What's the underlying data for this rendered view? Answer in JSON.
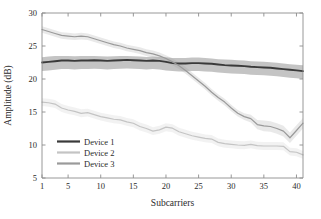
{
  "chart_data": {
    "type": "line",
    "title": "",
    "xlabel": "Subcarriers",
    "ylabel": "Amplitude (dB)",
    "xlim": [
      1,
      41
    ],
    "ylim": [
      5,
      30
    ],
    "xticks": [
      1,
      5,
      10,
      15,
      20,
      25,
      30,
      35,
      40
    ],
    "xticklabels": [
      "1",
      "5",
      "10",
      "15",
      "20",
      "25",
      "30",
      "35",
      "40"
    ],
    "yticks": [
      5,
      10,
      15,
      20,
      25,
      30
    ],
    "yticklabels": [
      "5",
      "10",
      "15",
      "20",
      "25",
      "30"
    ],
    "grid": false,
    "legend_position": "lower-left",
    "x": [
      1,
      2,
      3,
      4,
      5,
      6,
      7,
      8,
      9,
      10,
      11,
      12,
      13,
      14,
      15,
      16,
      17,
      18,
      19,
      20,
      21,
      22,
      23,
      24,
      25,
      26,
      27,
      28,
      29,
      30,
      31,
      32,
      33,
      34,
      35,
      36,
      37,
      38,
      39,
      40,
      41
    ],
    "series": [
      {
        "name": "Device 1",
        "color": "#3a3a3a",
        "values": [
          22.5,
          22.6,
          22.7,
          22.8,
          22.8,
          22.75,
          22.8,
          22.8,
          22.85,
          22.8,
          22.75,
          22.8,
          22.85,
          22.9,
          22.85,
          22.8,
          22.75,
          22.8,
          22.75,
          22.6,
          22.4,
          22.35,
          22.35,
          22.4,
          22.4,
          22.35,
          22.3,
          22.2,
          22.1,
          22.05,
          22.0,
          21.95,
          21.85,
          21.8,
          21.75,
          21.7,
          21.6,
          21.5,
          21.4,
          21.3,
          21.2
        ],
        "band_lower": [
          21.2,
          21.3,
          21.4,
          21.5,
          21.5,
          21.45,
          21.5,
          21.5,
          21.55,
          21.5,
          21.45,
          21.5,
          21.55,
          21.6,
          21.55,
          21.5,
          21.45,
          21.5,
          21.45,
          21.3,
          21.2,
          21.15,
          21.15,
          21.2,
          21.2,
          21.15,
          21.1,
          21.0,
          20.9,
          20.85,
          20.8,
          20.75,
          20.65,
          20.6,
          20.55,
          20.5,
          20.4,
          20.3,
          20.2,
          20.1,
          20.0
        ],
        "band_upper": [
          23.3,
          23.4,
          23.5,
          23.5,
          23.5,
          23.45,
          23.5,
          23.5,
          23.5,
          23.45,
          23.4,
          23.45,
          23.5,
          23.5,
          23.45,
          23.4,
          23.35,
          23.4,
          23.35,
          23.3,
          23.2,
          23.2,
          23.2,
          23.25,
          23.25,
          23.2,
          23.1,
          23.0,
          22.95,
          22.9,
          22.85,
          22.8,
          22.7,
          22.65,
          22.6,
          22.55,
          22.45,
          22.35,
          22.25,
          22.15,
          22.1
        ]
      },
      {
        "name": "Device 2",
        "color": "#c4c4c4",
        "values": [
          16.5,
          16.4,
          16.2,
          15.6,
          15.3,
          15.1,
          14.8,
          14.9,
          14.6,
          14.3,
          14.1,
          13.9,
          13.8,
          13.5,
          13.3,
          12.8,
          12.5,
          12.1,
          12.3,
          12.7,
          12.55,
          12.0,
          11.7,
          11.4,
          11.2,
          11.0,
          10.9,
          10.4,
          10.2,
          10.1,
          10.0,
          9.95,
          10.1,
          9.9,
          9.85,
          9.85,
          9.85,
          9.8,
          9.0,
          8.9,
          8.5
        ],
        "band_lower": [
          15.9,
          15.8,
          15.6,
          15.0,
          14.7,
          14.5,
          14.2,
          14.3,
          14.0,
          13.7,
          13.5,
          13.3,
          13.2,
          12.9,
          12.7,
          12.2,
          11.9,
          11.5,
          11.7,
          12.1,
          11.95,
          11.4,
          11.1,
          10.8,
          10.6,
          10.4,
          10.3,
          9.8,
          9.6,
          9.5,
          9.4,
          9.35,
          9.5,
          9.3,
          9.25,
          9.25,
          9.25,
          9.2,
          8.4,
          8.3,
          7.9
        ],
        "band_upper": [
          17.1,
          17.0,
          16.8,
          16.2,
          15.9,
          15.7,
          15.4,
          15.5,
          15.2,
          14.9,
          14.7,
          14.5,
          14.4,
          14.1,
          13.9,
          13.4,
          13.1,
          12.7,
          12.9,
          13.3,
          13.15,
          12.6,
          12.3,
          12.0,
          11.8,
          11.6,
          11.5,
          11.0,
          10.8,
          10.7,
          10.6,
          10.55,
          10.7,
          10.5,
          10.45,
          10.45,
          10.45,
          10.4,
          9.6,
          9.5,
          9.1
        ]
      },
      {
        "name": "Device 3",
        "color": "#9a9a9a",
        "values": [
          27.5,
          27.2,
          26.9,
          26.6,
          26.5,
          26.4,
          26.5,
          26.4,
          26.1,
          25.8,
          25.5,
          25.2,
          25.0,
          24.7,
          24.5,
          24.3,
          24.0,
          23.8,
          23.5,
          23.1,
          22.6,
          22.0,
          21.3,
          20.5,
          19.7,
          18.9,
          18.0,
          17.2,
          16.5,
          15.6,
          14.8,
          14.3,
          14.0,
          13.1,
          12.9,
          12.8,
          12.5,
          12.1,
          11.1,
          12.2,
          13.3
        ],
        "band_lower": [
          27.0,
          26.7,
          26.4,
          26.1,
          26.0,
          25.9,
          26.0,
          25.9,
          25.6,
          25.3,
          25.0,
          24.7,
          24.5,
          24.2,
          24.0,
          23.8,
          23.5,
          23.3,
          23.0,
          22.6,
          22.1,
          21.5,
          20.8,
          20.0,
          19.2,
          18.4,
          17.5,
          16.7,
          16.0,
          15.1,
          14.3,
          13.8,
          13.4,
          12.4,
          12.1,
          12.0,
          11.7,
          11.3,
          10.3,
          11.4,
          12.5
        ],
        "band_upper": [
          28.0,
          27.7,
          27.4,
          27.1,
          27.0,
          26.9,
          27.0,
          26.9,
          26.6,
          26.3,
          26.0,
          25.7,
          25.5,
          25.2,
          25.0,
          24.8,
          24.5,
          24.3,
          24.0,
          23.6,
          23.1,
          22.5,
          21.8,
          21.0,
          20.2,
          19.4,
          18.5,
          17.7,
          17.0,
          16.1,
          15.3,
          14.8,
          14.6,
          13.8,
          13.7,
          13.6,
          13.3,
          12.9,
          11.9,
          13.0,
          14.1
        ]
      }
    ]
  },
  "legend": {
    "items": [
      {
        "label": "Device 1"
      },
      {
        "label": "Device 2"
      },
      {
        "label": "Device 3"
      }
    ]
  }
}
